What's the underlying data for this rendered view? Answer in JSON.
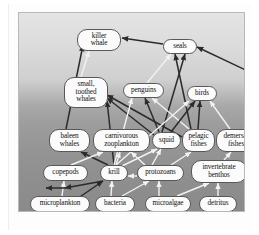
{
  "figure": {
    "background_top_color": "#e4e4e4",
    "background_bottom_color": "#8a8a8a",
    "frame_color": "#b8b8b8",
    "node_fill_color": "#fbfbfb",
    "node_border_color": "#585858",
    "edge_dark_color": "#2b2b2b",
    "edge_light_color": "#f2f2f2"
  },
  "nodes": [
    {
      "id": "killer-whale",
      "label": "killer\nwhale",
      "x": 58,
      "y": 16,
      "w": 44,
      "h": 22,
      "font": "f7"
    },
    {
      "id": "seals",
      "label": "seals",
      "x": 144,
      "y": 26,
      "w": 34,
      "h": 15,
      "font": "f7"
    },
    {
      "id": "small-toothed-whales",
      "label": "small,\ntoothed\nwhales",
      "x": 45,
      "y": 64,
      "w": 44,
      "h": 31,
      "font": "f7"
    },
    {
      "id": "penguins",
      "label": "penguins",
      "x": 104,
      "y": 70,
      "w": 41,
      "h": 15,
      "font": "f7"
    },
    {
      "id": "birds",
      "label": "birds",
      "x": 168,
      "y": 73,
      "w": 30,
      "h": 15,
      "font": "f7"
    },
    {
      "id": "baleen-whales",
      "label": "baleen\nwhales",
      "x": 30,
      "y": 116,
      "w": 41,
      "h": 23,
      "font": "f7"
    },
    {
      "id": "carnivorous-zooplankton",
      "label": "carnivorous\nzooplankton",
      "x": 74,
      "y": 116,
      "w": 57,
      "h": 23,
      "font": "f7"
    },
    {
      "id": "squid",
      "label": "squid",
      "x": 133,
      "y": 119,
      "w": 29,
      "h": 17,
      "font": "f7"
    },
    {
      "id": "pelagic-fishes",
      "label": "pelagic\nfishes",
      "x": 163,
      "y": 116,
      "w": 33,
      "h": 23,
      "font": "f7"
    },
    {
      "id": "demersal-fishes",
      "label": "demersal\nfishes",
      "x": 197,
      "y": 116,
      "w": 40,
      "h": 23,
      "font": "f7"
    },
    {
      "id": "copepods",
      "label": "copepods",
      "x": 24,
      "y": 152,
      "w": 45,
      "h": 16,
      "font": "f7"
    },
    {
      "id": "krill",
      "label": "krill",
      "x": 81,
      "y": 152,
      "w": 28,
      "h": 16,
      "font": "f7"
    },
    {
      "id": "protozoans",
      "label": "protozoans",
      "x": 118,
      "y": 152,
      "w": 47,
      "h": 16,
      "font": "f7"
    },
    {
      "id": "invertebrate-benthos",
      "label": "invertebrate\nbenthos",
      "x": 172,
      "y": 147,
      "w": 56,
      "h": 23,
      "font": "f7"
    },
    {
      "id": "microplankton",
      "label": "microplankton",
      "x": 11,
      "y": 183,
      "w": 60,
      "h": 16,
      "font": "f7"
    },
    {
      "id": "bacteria",
      "label": "bacteria",
      "x": 76,
      "y": 183,
      "w": 40,
      "h": 16,
      "font": "f7"
    },
    {
      "id": "microalgae",
      "label": "microalgae",
      "x": 126,
      "y": 183,
      "w": 46,
      "h": 16,
      "font": "f7"
    },
    {
      "id": "detritus",
      "label": "detritus",
      "x": 180,
      "y": 183,
      "w": 38,
      "h": 16,
      "font": "f7"
    }
  ],
  "edges": [
    {
      "from": "baleen-whales",
      "to": "killer-whale",
      "x1": 47,
      "y1": 116,
      "x2": 64,
      "y2": 32,
      "tone": "dark"
    },
    {
      "from": "seals",
      "to": "killer-whale",
      "x1": 144,
      "y1": 31,
      "x2": 103,
      "y2": 25,
      "tone": "dark"
    },
    {
      "from": "small-toothed-whales",
      "to": "killer-whale",
      "x1": 62,
      "y1": 64,
      "x2": 70,
      "y2": 38,
      "tone": "light"
    },
    {
      "from": "penguins",
      "to": "seals",
      "x1": 128,
      "y1": 70,
      "x2": 152,
      "y2": 41,
      "tone": "light"
    },
    {
      "from": "squid",
      "to": "seals",
      "x1": 143,
      "y1": 119,
      "x2": 166,
      "y2": 41,
      "tone": "dark"
    },
    {
      "from": "pelagic-fishes",
      "to": "seals",
      "x1": 172,
      "y1": 116,
      "x2": 156,
      "y2": 41,
      "tone": "dark"
    },
    {
      "from": "demersal-fishes",
      "to": "seals",
      "x1": 233,
      "y1": 116,
      "x2": 233,
      "y2": 60,
      "tone": "dark"
    },
    {
      "from": "demersal-fishes-b",
      "to": "seals",
      "x1": 233,
      "y1": 60,
      "x2": 178,
      "y2": 34,
      "tone": "dark"
    },
    {
      "from": "krill",
      "to": "small-toothed-whales",
      "x1": 95,
      "y1": 152,
      "x2": 88,
      "y2": 88,
      "tone": "dark"
    },
    {
      "from": "squid",
      "to": "small-toothed-whales",
      "x1": 135,
      "y1": 122,
      "x2": 88,
      "y2": 85,
      "tone": "dark"
    },
    {
      "from": "pelagic-fishes",
      "to": "small-toothed-whales",
      "x1": 163,
      "y1": 124,
      "x2": 88,
      "y2": 82,
      "tone": "dark"
    },
    {
      "from": "krill",
      "to": "penguins",
      "x1": 95,
      "y1": 152,
      "x2": 113,
      "y2": 85,
      "tone": "light"
    },
    {
      "from": "squid",
      "to": "penguins",
      "x1": 140,
      "y1": 119,
      "x2": 126,
      "y2": 85,
      "tone": "dark"
    },
    {
      "from": "pelagic-fishes",
      "to": "penguins",
      "x1": 170,
      "y1": 116,
      "x2": 133,
      "y2": 85,
      "tone": "light"
    },
    {
      "from": "krill",
      "to": "birds",
      "x1": 97,
      "y1": 152,
      "x2": 170,
      "y2": 88,
      "tone": "light"
    },
    {
      "from": "squid",
      "to": "birds",
      "x1": 152,
      "y1": 119,
      "x2": 176,
      "y2": 88,
      "tone": "dark"
    },
    {
      "from": "pelagic-fishes",
      "to": "birds",
      "x1": 179,
      "y1": 116,
      "x2": 181,
      "y2": 88,
      "tone": "dark"
    },
    {
      "from": "demersal-fishes",
      "to": "birds",
      "x1": 211,
      "y1": 116,
      "x2": 191,
      "y2": 88,
      "tone": "light"
    },
    {
      "from": "krill",
      "to": "baleen-whales",
      "x1": 89,
      "y1": 152,
      "x2": 62,
      "y2": 139,
      "tone": "dark"
    },
    {
      "from": "copepods",
      "to": "carnivorous-zooplankton",
      "x1": 52,
      "y1": 152,
      "x2": 84,
      "y2": 139,
      "tone": "light"
    },
    {
      "from": "krill",
      "to": "carnivorous-zooplankton",
      "x1": 97,
      "y1": 152,
      "x2": 101,
      "y2": 139,
      "tone": "light"
    },
    {
      "from": "protozoans",
      "to": "carnivorous-zooplankton",
      "x1": 126,
      "y1": 152,
      "x2": 112,
      "y2": 139,
      "tone": "light"
    },
    {
      "from": "krill",
      "to": "squid",
      "x1": 103,
      "y1": 153,
      "x2": 138,
      "y2": 136,
      "tone": "light"
    },
    {
      "from": "protozoans",
      "to": "squid",
      "x1": 133,
      "y1": 152,
      "x2": 142,
      "y2": 136,
      "tone": "light"
    },
    {
      "from": "protozoans",
      "to": "pelagic-fishes",
      "x1": 152,
      "y1": 152,
      "x2": 172,
      "y2": 139,
      "tone": "light"
    },
    {
      "from": "invertebrate-benthos",
      "to": "demersal-fishes",
      "x1": 205,
      "y1": 147,
      "x2": 212,
      "y2": 139,
      "tone": "light"
    },
    {
      "from": "microplankton",
      "to": "copepods",
      "x1": 43,
      "y1": 183,
      "x2": 45,
      "y2": 168,
      "tone": "light"
    },
    {
      "from": "microplankton",
      "to": "krill",
      "x1": 52,
      "y1": 190,
      "x2": 84,
      "y2": 168,
      "tone": "dark"
    },
    {
      "from": "bacteria",
      "to": "krill",
      "x1": 92,
      "y1": 183,
      "x2": 93,
      "y2": 168,
      "tone": "light"
    },
    {
      "from": "bacteria",
      "to": "protozoans",
      "x1": 103,
      "y1": 183,
      "x2": 130,
      "y2": 168,
      "tone": "light"
    },
    {
      "from": "microalgae",
      "to": "protozoans",
      "x1": 140,
      "y1": 183,
      "x2": 140,
      "y2": 168,
      "tone": "light"
    },
    {
      "from": "microalgae",
      "to": "invertebrate-benthos",
      "x1": 158,
      "y1": 183,
      "x2": 190,
      "y2": 170,
      "tone": "light"
    },
    {
      "from": "detritus",
      "to": "invertebrate-benthos",
      "x1": 199,
      "y1": 183,
      "x2": 199,
      "y2": 170,
      "tone": "light"
    },
    {
      "from": "detritus-floor",
      "to": "microplankton",
      "x1": 199,
      "y1": 199,
      "x2": 38,
      "y2": 204,
      "tone": "dark"
    },
    {
      "from": "krill-floor",
      "to": "copepods",
      "x1": 84,
      "y1": 168,
      "x2": 46,
      "y2": 175,
      "tone": "dark"
    },
    {
      "from": "copepods-floor",
      "to": "microplankton",
      "x1": 46,
      "y1": 175,
      "x2": 27,
      "y2": 175,
      "tone": "dark"
    },
    {
      "from": "protozoans-floor",
      "to": "krill",
      "x1": 118,
      "y1": 163,
      "x2": 109,
      "y2": 163,
      "tone": "light"
    }
  ]
}
